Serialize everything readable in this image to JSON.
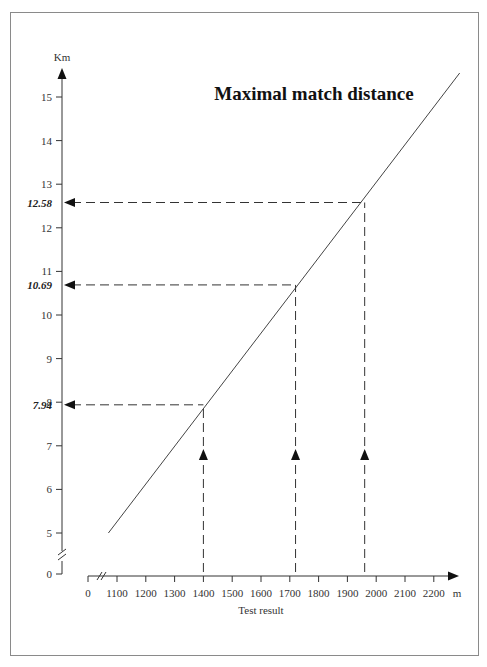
{
  "chart_data": {
    "type": "line",
    "title": "Maximal match distance",
    "xlabel": "Test result",
    "x_unit": "m",
    "ylabel": "Km",
    "x_ticks": [
      "0",
      "1100",
      "1200",
      "1300",
      "1400",
      "1500",
      "1600",
      "1700",
      "1800",
      "1900",
      "2000",
      "2100",
      "2200"
    ],
    "y_ticks": [
      "0",
      "5",
      "6",
      "7",
      "8",
      "9",
      "10",
      "11",
      "12",
      "13",
      "14",
      "15"
    ],
    "axis_breaks": {
      "x": "between 0 and 1100",
      "y": "between 0 and 5"
    },
    "xlim": [
      1000,
      2300
    ],
    "ylim": [
      4.5,
      15.8
    ],
    "grid": false,
    "legend": null,
    "series": [
      {
        "name": "Maximal match distance",
        "x": [
          1070,
          2290
        ],
        "y": [
          5.0,
          15.55
        ]
      }
    ],
    "annotations": [
      {
        "x": 1400,
        "y": 7.94,
        "label": "7.94"
      },
      {
        "x": 1720,
        "y": 10.69,
        "label": "10.69"
      },
      {
        "x": 1960,
        "y": 12.58,
        "label": "12.58"
      }
    ]
  },
  "labels": {
    "title": "Maximal match distance",
    "y_unit": "Km",
    "x_unit": "m",
    "x_title": "Test result",
    "y_zero": "0",
    "x_zero": "0"
  }
}
